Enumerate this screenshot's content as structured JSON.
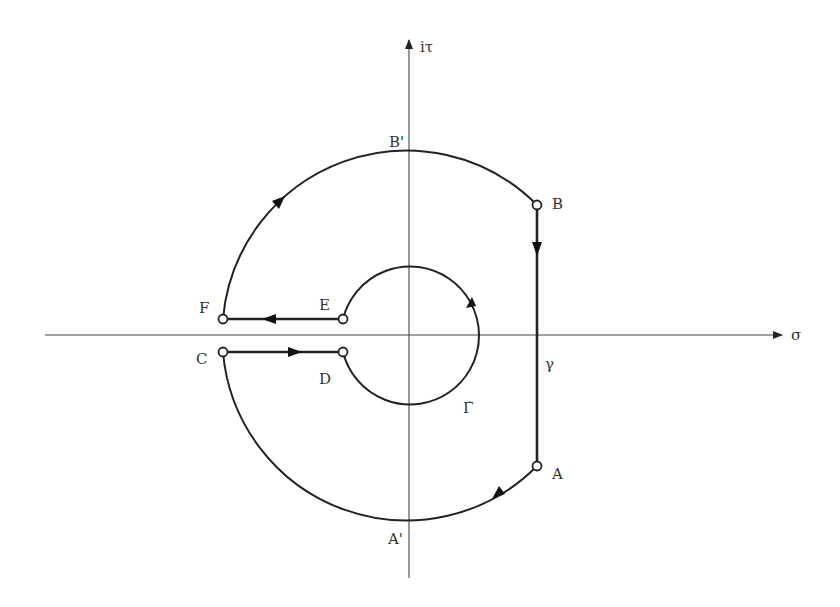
{
  "diagram": {
    "type": "contour-plane",
    "axes": {
      "horizontal_label": "σ",
      "vertical_label": "iτ"
    },
    "points": {
      "A": "A",
      "A_prime": "A'",
      "B": "B",
      "B_prime": "B'",
      "C": "C",
      "D": "D",
      "E": "E",
      "F": "F"
    },
    "paths": {
      "gamma": "γ",
      "gamma_dot": "Γ̇"
    },
    "colors": {
      "stroke": "#222222",
      "axis": "#444444",
      "text": "#333333",
      "background": "#ffffff"
    }
  }
}
